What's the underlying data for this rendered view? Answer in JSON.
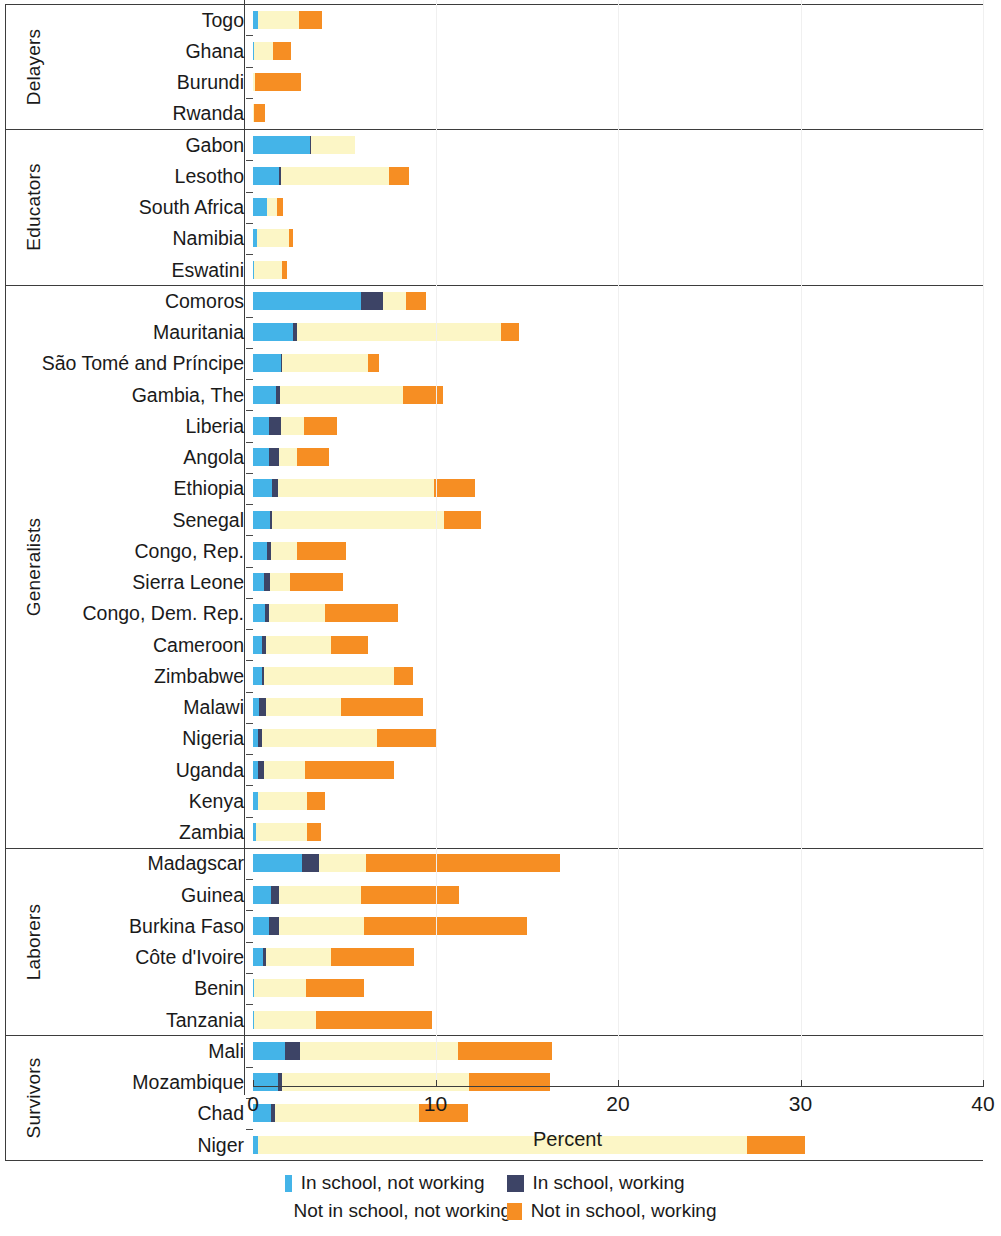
{
  "chart_data": {
    "type": "bar",
    "orientation": "horizontal",
    "stacked": true,
    "title": "",
    "xlabel": "Percent",
    "ylabel": "",
    "xlim": [
      0,
      40
    ],
    "xticks": [
      0,
      10,
      20,
      30,
      40
    ],
    "xtick_labels": [
      "0",
      "10",
      "20",
      "30",
      "40"
    ],
    "grid": "vertical-light",
    "legend_position": "bottom",
    "series": [
      {
        "name": "In school, not working",
        "color": "#44b4e8"
      },
      {
        "name": "In school, working",
        "color": "#3d4466"
      },
      {
        "name": "Not in school, not working",
        "color": "#fcf6c6"
      },
      {
        "name": "Not in school, working",
        "color": "#f68e23"
      }
    ],
    "groups": [
      {
        "name": "Delayers",
        "rows": [
          {
            "category": "Togo",
            "values": [
              0.3,
              0.0,
              2.2,
              1.3
            ]
          },
          {
            "category": "Ghana",
            "values": [
              0.05,
              0.0,
              1.05,
              1.0
            ]
          },
          {
            "category": "Burundi",
            "values": [
              0.0,
              0.0,
              0.1,
              2.55
            ]
          },
          {
            "category": "Rwanda",
            "values": [
              0.0,
              0.0,
              0.05,
              0.6
            ]
          }
        ]
      },
      {
        "name": "Educators",
        "rows": [
          {
            "category": "Gabon",
            "values": [
              3.1,
              0.1,
              2.4,
              0.0
            ]
          },
          {
            "category": "Lesotho",
            "values": [
              1.45,
              0.1,
              5.9,
              1.1
            ]
          },
          {
            "category": "South Africa",
            "values": [
              0.75,
              0.0,
              0.55,
              0.35
            ]
          },
          {
            "category": "Namibia",
            "values": [
              0.2,
              0.0,
              1.75,
              0.25
            ]
          },
          {
            "category": "Eswatini",
            "values": [
              0.05,
              0.0,
              1.55,
              0.25
            ]
          }
        ]
      },
      {
        "name": "Generalists",
        "rows": [
          {
            "category": "Comoros",
            "values": [
              5.9,
              1.2,
              1.3,
              1.1
            ]
          },
          {
            "category": "Mauritania",
            "values": [
              2.2,
              0.2,
              11.2,
              1.0
            ]
          },
          {
            "category": "São Tomé and Príncipe",
            "values": [
              1.55,
              0.05,
              4.7,
              0.6
            ]
          },
          {
            "category": "Gambia, The",
            "values": [
              1.25,
              0.25,
              6.7,
              2.2
            ]
          },
          {
            "category": "Liberia",
            "values": [
              0.9,
              0.65,
              1.25,
              1.8
            ]
          },
          {
            "category": "Angola",
            "values": [
              0.85,
              0.6,
              0.95,
              1.75
            ]
          },
          {
            "category": "Ethiopia",
            "values": [
              1.05,
              0.3,
              8.55,
              2.25
            ]
          },
          {
            "category": "Senegal",
            "values": [
              0.95,
              0.1,
              9.4,
              2.05
            ]
          },
          {
            "category": "Congo, Rep.",
            "values": [
              0.75,
              0.25,
              1.4,
              2.7
            ]
          },
          {
            "category": "Sierra Leone",
            "values": [
              0.6,
              0.35,
              1.1,
              2.9
            ]
          },
          {
            "category": "Congo, Dem. Rep.",
            "values": [
              0.65,
              0.25,
              3.05,
              4.0
            ]
          },
          {
            "category": "Cameroon",
            "values": [
              0.5,
              0.2,
              3.55,
              2.05
            ]
          },
          {
            "category": "Zimbabwe",
            "values": [
              0.5,
              0.1,
              7.1,
              1.05
            ]
          },
          {
            "category": "Malawi",
            "values": [
              0.35,
              0.35,
              4.1,
              4.5
            ]
          },
          {
            "category": "Nigeria",
            "values": [
              0.3,
              0.2,
              6.3,
              3.3
            ]
          },
          {
            "category": "Uganda",
            "values": [
              0.3,
              0.3,
              2.25,
              4.9
            ]
          },
          {
            "category": "Kenya",
            "values": [
              0.25,
              0.0,
              2.7,
              1.0
            ]
          },
          {
            "category": "Zambia",
            "values": [
              0.15,
              0.0,
              2.8,
              0.8
            ]
          }
        ]
      },
      {
        "name": "Laborers",
        "rows": [
          {
            "category": "Madagscar",
            "values": [
              2.7,
              0.9,
              2.6,
              10.6
            ]
          },
          {
            "category": "Guinea",
            "values": [
              1.0,
              0.4,
              4.5,
              5.4
            ]
          },
          {
            "category": "Burkina Faso",
            "values": [
              0.9,
              0.5,
              4.7,
              8.9
            ]
          },
          {
            "category": "Côte d'Ivoire",
            "values": [
              0.55,
              0.15,
              3.55,
              4.55
            ]
          },
          {
            "category": "Benin",
            "values": [
              0.05,
              0.0,
              2.85,
              3.2
            ]
          },
          {
            "category": "Tanzania",
            "values": [
              0.05,
              0.0,
              3.4,
              6.35
            ]
          }
        ]
      },
      {
        "name": "Survivors",
        "rows": [
          {
            "category": "Mali",
            "values": [
              1.75,
              0.85,
              8.65,
              5.15
            ]
          },
          {
            "category": "Mozambique",
            "values": [
              1.35,
              0.25,
              10.25,
              4.4
            ]
          },
          {
            "category": "Chad",
            "values": [
              1.0,
              0.2,
              7.9,
              2.7
            ]
          },
          {
            "category": "Niger",
            "values": [
              0.3,
              0.0,
              26.75,
              3.2
            ]
          }
        ]
      }
    ]
  },
  "axis": {
    "x_title": "Percent",
    "tick_labels": [
      "0",
      "10",
      "20",
      "30",
      "40"
    ]
  },
  "legend": {
    "items": [
      {
        "label": "In school, not working",
        "color": "#44b4e8",
        "icon": "square-swatch-icon"
      },
      {
        "label": "In school, working",
        "color": "#3d4466",
        "icon": "square-swatch-icon"
      },
      {
        "label": "Not in school, not working",
        "color": "#fcf6c6",
        "icon": "square-swatch-icon"
      },
      {
        "label": "Not in school, working",
        "color": "#f68e23",
        "icon": "square-swatch-icon"
      }
    ]
  }
}
